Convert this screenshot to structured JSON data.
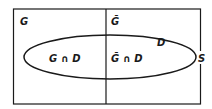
{
  "diagram": {
    "type": "venn",
    "universe_label": "S",
    "set_label_left": "G",
    "set_label_right": "Ḡ",
    "ellipse_label": "D",
    "region_left": "G ∩ D",
    "region_right": "Ḡ ∩ D",
    "colors": {
      "stroke": "#1a1a1a",
      "background": "#ffffff"
    }
  }
}
